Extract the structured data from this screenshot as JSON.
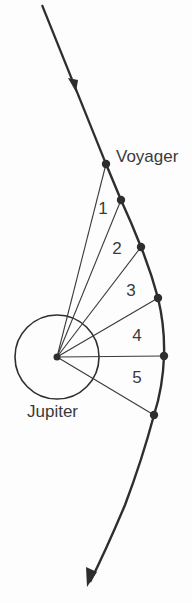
{
  "diagram": {
    "colors": {
      "ink": "#2e2e2e",
      "text": "#3a3a3a",
      "background": "#fdfdfd"
    },
    "labels": {
      "spacecraft": "Voyager",
      "planet": "Jupiter"
    },
    "planet": {
      "cx": 57,
      "cy": 357,
      "r": 42
    },
    "trajectory_points": [
      {
        "x": 106,
        "y": 164
      },
      {
        "x": 121,
        "y": 200
      },
      {
        "x": 141,
        "y": 247
      },
      {
        "x": 158,
        "y": 298
      },
      {
        "x": 164,
        "y": 356
      },
      {
        "x": 154,
        "y": 415
      }
    ],
    "sectors": [
      {
        "label": "1",
        "x": 103,
        "y": 208
      },
      {
        "label": "2",
        "x": 117,
        "y": 248
      },
      {
        "label": "3",
        "x": 131,
        "y": 290
      },
      {
        "label": "4",
        "x": 137,
        "y": 335
      },
      {
        "label": "5",
        "x": 137,
        "y": 377
      }
    ]
  }
}
